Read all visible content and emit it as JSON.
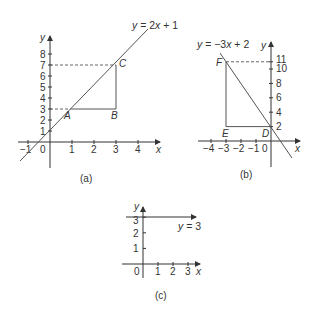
{
  "figure": {
    "panels": [
      {
        "caption": "(a)",
        "equation": "y = 2x + 1",
        "x_axis_label": "x",
        "y_axis_label": "y",
        "x_ticks": [
          "−1",
          "0",
          "1",
          "2",
          "3",
          "4"
        ],
        "y_ticks": [
          "1",
          "2",
          "3",
          "4",
          "5",
          "6",
          "7",
          "8"
        ],
        "points": [
          {
            "label": "A",
            "x": 1,
            "y": 3
          },
          {
            "label": "B",
            "x": 3,
            "y": 3
          },
          {
            "label": "C",
            "x": 3,
            "y": 7
          }
        ]
      },
      {
        "caption": "(b)",
        "equation": "y = −3x + 2",
        "x_axis_label": "x",
        "y_axis_label": "y",
        "x_ticks": [
          "−4",
          "−3",
          "−2",
          "−1",
          "0"
        ],
        "y_ticks": [
          "2",
          "4",
          "6",
          "8",
          "10",
          "11"
        ],
        "points": [
          {
            "label": "F",
            "x": -3,
            "y": 11
          },
          {
            "label": "E",
            "x": -3,
            "y": 2
          },
          {
            "label": "D",
            "x": 0,
            "y": 2
          }
        ]
      },
      {
        "caption": "(c)",
        "equation": "y = 3",
        "x_axis_label": "x",
        "y_axis_label": "y",
        "x_ticks": [
          "0",
          "1",
          "2",
          "3"
        ],
        "y_ticks": [
          "1",
          "2",
          "3"
        ]
      }
    ]
  },
  "labels": {
    "a": {
      "eq_y": "y",
      "eq_rest": " = 2",
      "eq_x": "x",
      "eq_tail": " + 1",
      "x": "x",
      "y": "y",
      "A": "A",
      "B": "B",
      "C": "C",
      "xt_m1": "−1",
      "xt_0": "0",
      "xt_1": "1",
      "xt_2": "2",
      "xt_3": "3",
      "xt_4": "4",
      "yt_1": "1",
      "yt_2": "2",
      "yt_3": "3",
      "yt_4": "4",
      "yt_5": "5",
      "yt_6": "6",
      "yt_7": "7",
      "yt_8": "8",
      "caption": "(a)"
    },
    "b": {
      "eq_y": "y",
      "eq_rest": " = −3",
      "eq_x": "x",
      "eq_tail": " + 2",
      "x": "x",
      "y": "y",
      "D": "D",
      "E": "E",
      "F": "F",
      "xt_m4": "−4",
      "xt_m3": "−3",
      "xt_m2": "−2",
      "xt_m1": "−1",
      "xt_0": "0",
      "yt_2": "2",
      "yt_4": "4",
      "yt_6": "6",
      "yt_8": "8",
      "yt_10": "10",
      "yt_11": "11",
      "caption": "(b)"
    },
    "c": {
      "eq_y": "y",
      "eq_rest": " = 3",
      "x": "x",
      "y": "y",
      "xt_0": "0",
      "xt_1": "1",
      "xt_2": "2",
      "xt_3": "3",
      "yt_1": "1",
      "yt_2": "2",
      "yt_3": "3",
      "caption": "(c)"
    }
  }
}
